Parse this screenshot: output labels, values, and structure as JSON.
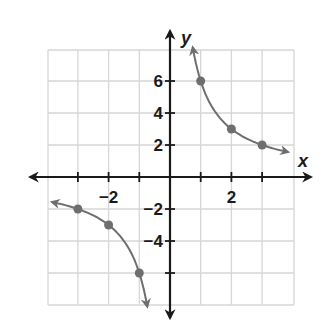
{
  "chart_data": {
    "type": "line",
    "title": "",
    "function": "y = 6/x",
    "xlabel": "x",
    "ylabel": "y",
    "xlim": [
      -4,
      4
    ],
    "ylim": [
      -8,
      8
    ],
    "grid": true,
    "x_ticks": [
      -3,
      -2,
      -1,
      1,
      2,
      3
    ],
    "y_ticks": [
      -6,
      -4,
      -2,
      2,
      4,
      6
    ],
    "x_tick_labels": [
      {
        "value": -2,
        "label": "−2"
      },
      {
        "value": 2,
        "label": "2"
      }
    ],
    "y_tick_labels": [
      {
        "value": 6,
        "label": "6"
      },
      {
        "value": 4,
        "label": "4"
      },
      {
        "value": 2,
        "label": "2"
      },
      {
        "value": -2,
        "label": "−2"
      },
      {
        "value": -4,
        "label": "−4"
      }
    ],
    "series": [
      {
        "name": "branch-right",
        "points": [
          [
            1,
            6
          ],
          [
            2,
            3
          ],
          [
            3,
            2
          ]
        ]
      },
      {
        "name": "branch-left",
        "points": [
          [
            -3,
            -2
          ],
          [
            -2,
            -3
          ],
          [
            -1,
            -6
          ]
        ]
      }
    ],
    "colors": {
      "curve": "#6e6e6e",
      "axis": "#1a1a1a",
      "grid": "#d6d6d6"
    }
  }
}
